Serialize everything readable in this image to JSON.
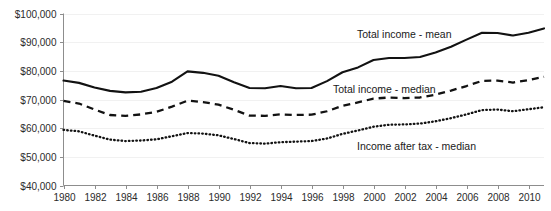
{
  "chart_data": {
    "type": "line",
    "title": "",
    "xlabel": "",
    "ylabel": "",
    "grid": true,
    "legend_position": "inline-annotations",
    "xlim": [
      1980,
      2011
    ],
    "ylim": [
      40000,
      100000
    ],
    "ytick_labels": [
      "$100,000",
      "$90,000",
      "$80,000",
      "$70,000",
      "$60,000",
      "$50,000",
      "$40,000"
    ],
    "ytick_values": [
      100000,
      90000,
      80000,
      70000,
      60000,
      50000,
      40000
    ],
    "xtick_labels": [
      "1980",
      "1982",
      "1984",
      "1986",
      "1988",
      "1990",
      "1992",
      "1994",
      "1996",
      "1998",
      "2000",
      "2002",
      "2004",
      "2006",
      "2008",
      "2010"
    ],
    "xtick_values": [
      1980,
      1982,
      1984,
      1986,
      1988,
      1990,
      1992,
      1994,
      1996,
      1998,
      2000,
      2002,
      2004,
      2006,
      2008,
      2010
    ],
    "x": [
      1980,
      1981,
      1982,
      1983,
      1984,
      1985,
      1986,
      1987,
      1988,
      1989,
      1990,
      1991,
      1992,
      1993,
      1994,
      1995,
      1996,
      1997,
      1998,
      1999,
      2000,
      2001,
      2002,
      2003,
      2004,
      2005,
      2006,
      2007,
      2008,
      2009,
      2010,
      2011
    ],
    "series": [
      {
        "name": "Total income - mean",
        "style": "solid",
        "color": "#121212",
        "values": [
          76600,
          75800,
          74200,
          73000,
          72500,
          72700,
          74000,
          76200,
          79800,
          79300,
          78300,
          76000,
          74000,
          73900,
          74700,
          73900,
          74000,
          76400,
          79500,
          81200,
          83800,
          84500,
          84500,
          84800,
          86400,
          88400,
          90900,
          93300,
          93200,
          92300,
          93300,
          94800
        ]
      },
      {
        "name": "Total income - median",
        "style": "dashed",
        "color": "#121212",
        "values": [
          69500,
          68600,
          66500,
          64600,
          64300,
          64800,
          65700,
          67500,
          69600,
          69100,
          68200,
          66400,
          64400,
          64300,
          64800,
          64600,
          64700,
          65900,
          67800,
          69000,
          70300,
          70700,
          70500,
          70700,
          71700,
          73100,
          74700,
          76500,
          76600,
          75900,
          76800,
          77900
        ]
      },
      {
        "name": "Income after tax - median",
        "style": "dotted",
        "color": "#121212",
        "values": [
          59400,
          58900,
          57400,
          56000,
          55500,
          55700,
          56100,
          57200,
          58300,
          58100,
          57500,
          56200,
          54800,
          54600,
          55100,
          55300,
          55500,
          56400,
          58000,
          59200,
          60500,
          61200,
          61300,
          61600,
          62400,
          63500,
          64800,
          66300,
          66500,
          65900,
          66600,
          67300
        ]
      }
    ],
    "annotations": [
      {
        "text": "Total income - mean",
        "x": 357,
        "y": 38
      },
      {
        "text": "Total income - median",
        "x": 333,
        "y": 93
      },
      {
        "text": "Income after tax - median",
        "x": 357,
        "y": 150
      }
    ]
  }
}
